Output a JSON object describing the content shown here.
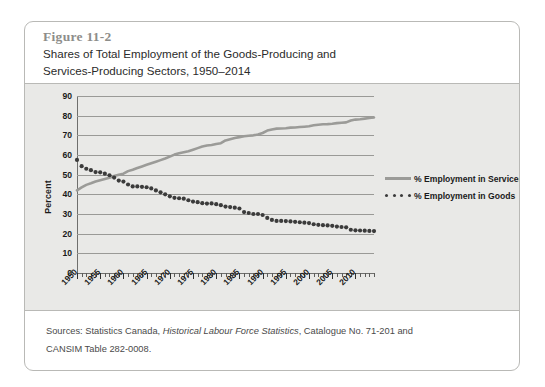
{
  "figure": {
    "number": "Figure 11-2",
    "title_line1": "Shares of Total Employment of the Goods-Producing and",
    "title_line2": "Services-Producing Sectors, 1950–2014",
    "source_prefix": "Sources: Statistics Canada,",
    "source_italic": "Historical Labour Force Statistics",
    "source_suffix": ", Catalogue No. 71-201 and",
    "source_line2": "CANSIM Table 282-0008."
  },
  "colors": {
    "services_line": "#9b9b98",
    "goods_dots": "#3b3b3b",
    "plot_background": "#e9e9e7",
    "gridline": "#9a9a97",
    "axis": "#6f6f6d",
    "card_border": "#b9b9b6",
    "figure_number_text": "#8d8d8a",
    "title_text": "#2b2b2b",
    "source_text": "#4a4a4a"
  },
  "chart_data": {
    "type": "line",
    "title": "Shares of Total Employment of the Goods-Producing and Services-Producing Sectors, 1950–2014",
    "xlabel": "",
    "ylabel": "Percent",
    "ylim": [
      0,
      90
    ],
    "ytick_labels": [
      "0",
      "10",
      "20",
      "30",
      "40",
      "50",
      "60",
      "70",
      "80",
      "90"
    ],
    "yticks": [
      0,
      10,
      20,
      30,
      40,
      50,
      60,
      70,
      80,
      90
    ],
    "xlim": [
      1950,
      2014
    ],
    "xticks": [
      1950,
      1955,
      1960,
      1965,
      1970,
      1975,
      1980,
      1985,
      1990,
      1995,
      2000,
      2005,
      2010
    ],
    "xtick_labels": [
      "1950",
      "1955",
      "1960",
      "1965",
      "1970",
      "1975",
      "1980",
      "1985",
      "1990",
      "1995",
      "2000",
      "2005",
      "2010"
    ],
    "x_minor_tick_interval": 1,
    "grid": "horizontal",
    "legend_position": "right",
    "x": [
      1950,
      1951,
      1952,
      1953,
      1954,
      1955,
      1956,
      1957,
      1958,
      1959,
      1960,
      1961,
      1962,
      1963,
      1964,
      1965,
      1966,
      1967,
      1968,
      1969,
      1970,
      1971,
      1972,
      1973,
      1974,
      1975,
      1976,
      1977,
      1978,
      1979,
      1980,
      1981,
      1982,
      1983,
      1984,
      1985,
      1986,
      1987,
      1988,
      1989,
      1990,
      1991,
      1992,
      1993,
      1994,
      1995,
      1996,
      1997,
      1998,
      1999,
      2000,
      2001,
      2002,
      2003,
      2004,
      2005,
      2006,
      2007,
      2008,
      2009,
      2010,
      2011,
      2012,
      2013,
      2014
    ],
    "series": [
      {
        "name": "% Employment in Services",
        "style": "solid-line",
        "color": "#9b9b98",
        "values": [
          42.0,
          43.5,
          44.8,
          45.6,
          46.5,
          47.2,
          47.8,
          48.4,
          49.3,
          50.0,
          50.5,
          51.8,
          52.5,
          53.4,
          54.2,
          55.0,
          55.8,
          56.6,
          57.4,
          58.2,
          59.2,
          60.2,
          60.9,
          61.4,
          61.9,
          62.7,
          63.5,
          64.3,
          64.8,
          65.1,
          65.6,
          66.0,
          67.4,
          68.0,
          68.6,
          69.1,
          69.5,
          69.8,
          70.0,
          70.4,
          71.2,
          72.4,
          73.0,
          73.4,
          73.5,
          73.6,
          73.9,
          74.0,
          74.2,
          74.4,
          74.6,
          75.1,
          75.4,
          75.6,
          75.7,
          75.9,
          76.2,
          76.4,
          76.6,
          77.5,
          78.0,
          78.2,
          78.5,
          78.8,
          79.1
        ]
      },
      {
        "name": "% Employment in Goods",
        "style": "dotted",
        "color": "#3b3b3b",
        "values": [
          57.5,
          54.3,
          53.0,
          52.3,
          51.3,
          51.2,
          50.5,
          49.7,
          48.5,
          47.0,
          46.5,
          45.0,
          44.0,
          44.0,
          43.8,
          43.6,
          43.0,
          42.0,
          41.0,
          40.0,
          39.0,
          38.2,
          38.0,
          37.8,
          37.0,
          36.3,
          36.0,
          35.5,
          35.3,
          35.4,
          35.0,
          34.5,
          33.8,
          33.5,
          33.2,
          32.8,
          31.0,
          30.5,
          30.0,
          30.0,
          29.5,
          28.0,
          27.0,
          26.5,
          26.5,
          26.4,
          26.2,
          26.0,
          25.8,
          25.6,
          25.4,
          24.8,
          24.5,
          24.3,
          24.2,
          24.0,
          23.6,
          23.4,
          23.2,
          22.0,
          21.7,
          21.6,
          21.5,
          21.4,
          21.3
        ]
      }
    ]
  },
  "legend": [
    {
      "label": "% Employment in Services",
      "style": "solid-line"
    },
    {
      "label": "% Employment in Goods",
      "style": "dotted"
    }
  ]
}
